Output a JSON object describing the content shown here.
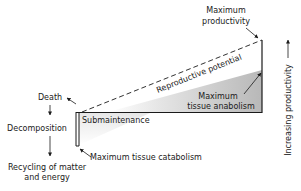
{
  "diagram": {
    "labels": {
      "max_productivity_line1": "Maximum",
      "max_productivity_line2": "productivity",
      "reproductive_potential": "Reproductive potential",
      "max_anabolism_line1": "Maximum",
      "max_anabolism_line2": "tissue anabolism",
      "submaintenance": "Submaintenance",
      "max_catabolism": "Maximum tissue catabolism",
      "death": "Death",
      "decomposition": "Decomposition",
      "recycling_line1": "Recycling of matter",
      "recycling_line2": "and energy",
      "increasing_productivity": "Increasing productivity"
    },
    "colors": {
      "line": "#1a1a1a",
      "shade_dark": "#b8b8b8",
      "shade_light": "#ffffff"
    }
  }
}
